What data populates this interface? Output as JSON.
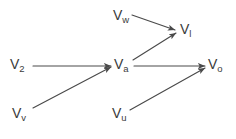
{
  "figure": {
    "type": "directed-graph",
    "background_color": "#ffffff",
    "edge_color": "#4a4a4a",
    "label_color": "#3b3b3b",
    "width": 236,
    "height": 139
  },
  "nodes": [
    {
      "id": "Vw",
      "base": "V",
      "sub": "w",
      "x": 113,
      "y": 8,
      "label": "Vw"
    },
    {
      "id": "Vl",
      "base": "V",
      "sub": "l",
      "x": 180,
      "y": 22,
      "label": "Vl"
    },
    {
      "id": "V2",
      "base": "V",
      "sub": "2",
      "x": 10,
      "y": 57,
      "label": "V2"
    },
    {
      "id": "Va",
      "base": "V",
      "sub": "a",
      "x": 114,
      "y": 57,
      "label": "Va"
    },
    {
      "id": "Vo",
      "base": "V",
      "sub": "o",
      "x": 208,
      "y": 57,
      "label": "Vo"
    },
    {
      "id": "Vv",
      "base": "V",
      "sub": "v",
      "x": 12,
      "y": 106,
      "label": "Vv"
    },
    {
      "id": "Vu",
      "base": "V",
      "sub": "u",
      "x": 112,
      "y": 106,
      "label": "Vu"
    }
  ],
  "edges": [
    {
      "id": "edge-vw-vl",
      "from": "Vw",
      "to": "Vl",
      "x1": 132,
      "y1": 15,
      "x2": 175,
      "y2": 30,
      "arrow": true
    },
    {
      "id": "edge-va-vl",
      "from": "Va",
      "to": "Vl",
      "x1": 133,
      "y1": 60,
      "x2": 176,
      "y2": 33,
      "arrow": true
    },
    {
      "id": "edge-v2-va",
      "from": "V2",
      "to": "Va",
      "x1": 33,
      "y1": 66,
      "x2": 111,
      "y2": 66,
      "arrow": true
    },
    {
      "id": "edge-vv-va",
      "from": "Vv",
      "to": "Va",
      "x1": 33,
      "y1": 108,
      "x2": 111,
      "y2": 67,
      "arrow": true
    },
    {
      "id": "edge-va-vo",
      "from": "Va",
      "to": "Vo",
      "x1": 134,
      "y1": 66,
      "x2": 205,
      "y2": 66,
      "arrow": true
    },
    {
      "id": "edge-vu-vo",
      "from": "Vu",
      "to": "Vo",
      "x1": 130,
      "y1": 110,
      "x2": 205,
      "y2": 68,
      "arrow": true
    }
  ]
}
